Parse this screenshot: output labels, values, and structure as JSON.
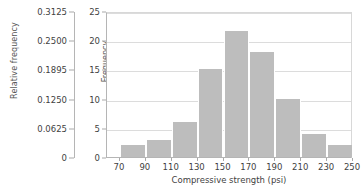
{
  "chart_data": {
    "type": "bar",
    "title": "",
    "xlabel": "Compressive strength (psi)",
    "ylabel": "Frequency",
    "secondary_ylabel": "Relative frequency",
    "categories": [
      "70-90",
      "90-110",
      "110-130",
      "130-150",
      "150-170",
      "170-190",
      "190-210",
      "210-230",
      "230-250"
    ],
    "bin_edges": [
      70,
      90,
      110,
      130,
      150,
      170,
      190,
      210,
      230,
      250
    ],
    "values": [
      2,
      3,
      6,
      15,
      21.5,
      18,
      10,
      4,
      2
    ],
    "relative_values": [
      0.025,
      0.0375,
      0.075,
      0.1875,
      0.26875,
      0.225,
      0.125,
      0.05,
      0.025
    ],
    "xlim": [
      60,
      250
    ],
    "ylim": [
      0,
      25
    ],
    "secondary_ylim": [
      0,
      0.3125
    ],
    "xticks": [
      70,
      90,
      110,
      130,
      150,
      170,
      190,
      210,
      230,
      250
    ],
    "xtick_labels": [
      "70",
      "90",
      "110",
      "130",
      "150",
      "170",
      "190",
      "210",
      "230",
      "250"
    ],
    "yticks": [
      0,
      5,
      10,
      15,
      20,
      25
    ],
    "ytick_labels": [
      "0",
      "5",
      "10",
      "15",
      "20",
      "25"
    ],
    "secondary_yticks": [
      0,
      0.0625,
      0.125,
      0.1895,
      0.25,
      0.3125
    ],
    "secondary_ytick_labels": [
      "0",
      "0.0625",
      "0.1250",
      "0.1895",
      "0.2500",
      "0.3125"
    ],
    "grid": true,
    "grid_axis": "y",
    "legend": false,
    "bar_color": "#bdbdbd",
    "grid_color": "#dcdcdc",
    "axis_color": "#b5b5b5",
    "text_color": "#3f3f3f"
  }
}
